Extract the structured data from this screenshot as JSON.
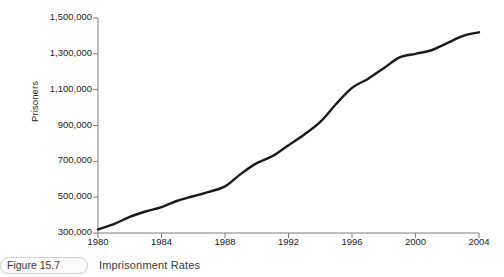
{
  "caption": {
    "figure_label": "Figure 15.7",
    "title": "Imprisonment Rates"
  },
  "chart_data": {
    "type": "line",
    "title": "Imprisonment Rates",
    "xlabel": "",
    "ylabel": "Prisoners",
    "xlim": [
      1980,
      2004
    ],
    "ylim": [
      300000,
      1500000
    ],
    "grid": false,
    "legend": null,
    "line_color": "#1a1a1a",
    "xticks": [
      1980,
      1984,
      1988,
      1992,
      1996,
      2000,
      2004
    ],
    "xtick_labels": [
      "1980",
      "1984",
      "1988",
      "1992",
      "1996",
      "2000",
      "2004"
    ],
    "yticks": [
      300000,
      500000,
      700000,
      900000,
      1100000,
      1300000,
      1500000
    ],
    "ytick_labels": [
      "300,000",
      "500,000",
      "700,000",
      "900,000",
      "1,100,000",
      "1,300,000",
      "1,500,000"
    ],
    "x": [
      1980,
      1981,
      1982,
      1983,
      1984,
      1985,
      1986,
      1987,
      1988,
      1989,
      1990,
      1991,
      1992,
      1993,
      1994,
      1995,
      1996,
      1997,
      1998,
      1999,
      2000,
      2001,
      2002,
      2003,
      2004
    ],
    "values": [
      320000,
      350000,
      390000,
      420000,
      445000,
      480000,
      505000,
      530000,
      560000,
      630000,
      690000,
      730000,
      790000,
      850000,
      920000,
      1020000,
      1110000,
      1160000,
      1220000,
      1280000,
      1300000,
      1320000,
      1360000,
      1400000,
      1420000
    ],
    "series": [
      {
        "name": "Prisoners",
        "values": [
          320000,
          350000,
          390000,
          420000,
          445000,
          480000,
          505000,
          530000,
          560000,
          630000,
          690000,
          730000,
          790000,
          850000,
          920000,
          1020000,
          1110000,
          1160000,
          1220000,
          1280000,
          1300000,
          1320000,
          1360000,
          1400000,
          1420000
        ]
      }
    ]
  }
}
